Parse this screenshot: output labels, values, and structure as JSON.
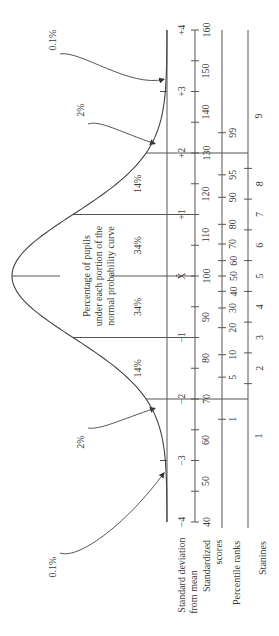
{
  "diagram": {
    "orientation": "rotated-90-ccw",
    "curve_label_lines": [
      "Percentage of pupils",
      "under each portion of the",
      "normal probability curve"
    ],
    "area_percentages": [
      {
        "region": "below -3",
        "label": "0.1%"
      },
      {
        "region": "-3 to -2",
        "label": "2%"
      },
      {
        "region": "-2 to -1",
        "label": "14%"
      },
      {
        "region": "-1 to mean",
        "label": "34%"
      },
      {
        "region": "mean to +1",
        "label": "34%"
      },
      {
        "region": "+1 to +2",
        "label": "14%"
      },
      {
        "region": "+2 to +3",
        "label": "2%"
      },
      {
        "region": "above +3",
        "label": "0.1%"
      }
    ],
    "row_labels": {
      "sd": [
        "Standard deviation",
        "from mean"
      ],
      "standardized": [
        "Standardized",
        "scores"
      ],
      "percentile": "Percentile ranks",
      "stanines": "Stanines"
    },
    "sd_ticks": [
      {
        "z": -4,
        "label": "−4"
      },
      {
        "z": -3,
        "label": "−3"
      },
      {
        "z": -2,
        "label": "−2"
      },
      {
        "z": -1,
        "label": "−1"
      },
      {
        "z": 0,
        "label": "X̄"
      },
      {
        "z": 1,
        "label": "+1"
      },
      {
        "z": 2,
        "label": "+2"
      },
      {
        "z": 3,
        "label": "+3"
      },
      {
        "z": 4,
        "label": "+4"
      }
    ],
    "standardized_scores": [
      {
        "z": -4,
        "label": "40"
      },
      {
        "z": -3.333,
        "label": "50"
      },
      {
        "z": -2.667,
        "label": "60"
      },
      {
        "z": -2,
        "label": "70"
      },
      {
        "z": -1.333,
        "label": "80"
      },
      {
        "z": -0.667,
        "label": "90"
      },
      {
        "z": 0,
        "label": "100"
      },
      {
        "z": 0.667,
        "label": "110"
      },
      {
        "z": 1.333,
        "label": "120"
      },
      {
        "z": 2,
        "label": "130"
      },
      {
        "z": 2.667,
        "label": "140"
      },
      {
        "z": 3.333,
        "label": "150"
      },
      {
        "z": 4,
        "label": "160"
      }
    ],
    "percentile_ranks": [
      {
        "z": -2.33,
        "label": "1"
      },
      {
        "z": -1.645,
        "label": "5"
      },
      {
        "z": -1.28,
        "label": "10"
      },
      {
        "z": -0.84,
        "label": "20"
      },
      {
        "z": -0.52,
        "label": "30"
      },
      {
        "z": -0.25,
        "label": "40"
      },
      {
        "z": 0,
        "label": "50"
      },
      {
        "z": 0.25,
        "label": "60"
      },
      {
        "z": 0.52,
        "label": "70"
      },
      {
        "z": 0.84,
        "label": "80"
      },
      {
        "z": 1.28,
        "label": "90"
      },
      {
        "z": 1.645,
        "label": "95"
      },
      {
        "z": 2.33,
        "label": "99"
      }
    ],
    "stanines": [
      {
        "z": -2.6,
        "label": "1"
      },
      {
        "z": -1.5,
        "label": "2"
      },
      {
        "z": -1.0,
        "label": "3"
      },
      {
        "z": -0.5,
        "label": "4"
      },
      {
        "z": 0,
        "label": "5"
      },
      {
        "z": 0.5,
        "label": "6"
      },
      {
        "z": 1.0,
        "label": "7"
      },
      {
        "z": 1.5,
        "label": "8"
      },
      {
        "z": 2.6,
        "label": "9"
      }
    ],
    "stanine_boundaries": [
      -1.75,
      -1.25,
      -0.75,
      -0.25,
      0.25,
      0.75,
      1.25,
      1.75
    ]
  }
}
